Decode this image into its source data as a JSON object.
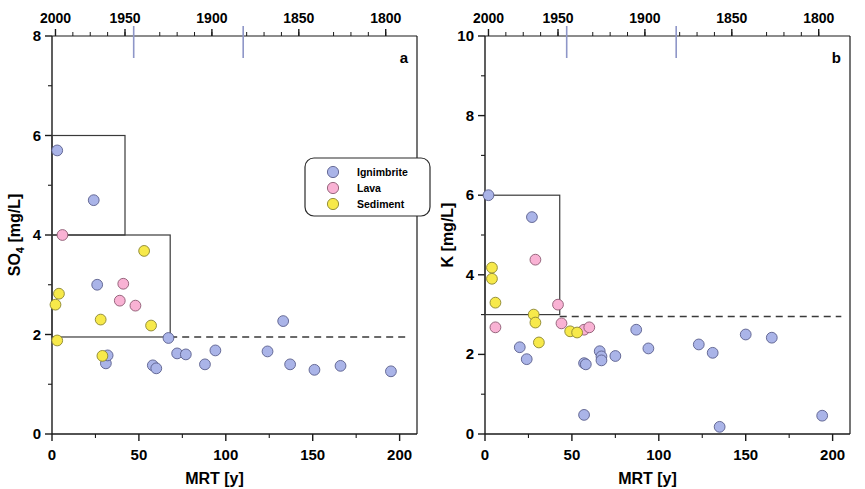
{
  "figure": {
    "panels": [
      {
        "letter": "a",
        "xlabel": "MRT [y]",
        "ylabel_main": "SO",
        "ylabel_sub": "4",
        "ylabel_unit": " [mg/L]",
        "ylabel_full": "SO4 [mg/L]"
      },
      {
        "letter": "b",
        "xlabel": "MRT [y]",
        "ylabel_main": "K",
        "ylabel_sub": "",
        "ylabel_unit": " [mg/L]",
        "ylabel_full": "K [mg/L]"
      }
    ]
  },
  "legend": {
    "position": "upper-right-panel-a",
    "items": [
      {
        "label": "Ignimbrite",
        "color": "#aab4e8",
        "edge": "#5a5f8c"
      },
      {
        "label": "Lava",
        "color": "#f9b2d4",
        "edge": "#8c5a72"
      },
      {
        "label": "Sediment",
        "color": "#f7e94a",
        "edge": "#8a8430"
      }
    ]
  },
  "colors": {
    "ignimbrite": "#aab4e8",
    "ignimbrite_edge": "#5a5f8c",
    "lava": "#f9b2d4",
    "lava_edge": "#8c5a72",
    "sediment": "#f7e94a",
    "sediment_edge": "#8a8430",
    "axis": "#1a1a1a",
    "box": "#3a3a3a",
    "dashed": "#3a3a3a",
    "top_marker": "#8e96c8"
  },
  "chart_data": [
    {
      "type": "scatter",
      "panel": "a",
      "title": "",
      "xlabel": "MRT [y]",
      "ylabel": "SO4 [mg/L]",
      "xlim": [
        0,
        210
      ],
      "ylim": [
        0,
        8
      ],
      "xticks": [
        0,
        50,
        100,
        150,
        200
      ],
      "xticklabels": [
        "0",
        "50",
        "100",
        "150",
        "200"
      ],
      "xminorticks": [
        25,
        75,
        125,
        175
      ],
      "yticks": [
        0,
        2,
        4,
        6,
        8
      ],
      "yticklabels": [
        "0",
        "2",
        "4",
        "6",
        "8"
      ],
      "yminorticks": [
        1,
        3,
        5,
        7
      ],
      "grid": false,
      "top_axis": {
        "label": "",
        "ticklabels": [
          "2000",
          "1950",
          "1900",
          "1850",
          "1800"
        ],
        "tickvalues_year": [
          2000,
          1950,
          1900,
          1850,
          1800
        ],
        "tick_x_mrt": [
          2,
          42,
          92,
          142,
          192
        ],
        "marker_years": [
          1952,
          1920
        ],
        "marker_x_mrt": [
          47,
          110
        ]
      },
      "reference_line": {
        "style": "dashed",
        "y": 1.95,
        "x_from": 68,
        "x_to": 205
      },
      "boxes": [
        {
          "x0": 0,
          "x1": 42,
          "y0": 4.0,
          "y1": 6.0
        },
        {
          "x0": 0,
          "x1": 68,
          "y0": 1.95,
          "y1": 4.0
        }
      ],
      "series": [
        {
          "name": "Ignimbrite",
          "color": "#aab4e8",
          "points": [
            [
              3,
              5.7
            ],
            [
              24,
              4.7
            ],
            [
              26,
              3.0
            ],
            [
              31,
              1.42
            ],
            [
              32,
              1.58
            ],
            [
              58,
              1.38
            ],
            [
              60,
              1.32
            ],
            [
              67,
              1.93
            ],
            [
              72,
              1.62
            ],
            [
              77,
              1.6
            ],
            [
              88,
              1.4
            ],
            [
              94,
              1.68
            ],
            [
              124,
              1.66
            ],
            [
              133,
              2.27
            ],
            [
              137,
              1.4
            ],
            [
              151,
              1.29
            ],
            [
              166,
              1.37
            ],
            [
              195,
              1.26
            ]
          ]
        },
        {
          "name": "Lava",
          "color": "#f9b2d4",
          "points": [
            [
              6,
              4.0
            ],
            [
              41,
              3.02
            ],
            [
              39,
              2.68
            ],
            [
              48,
              2.58
            ]
          ]
        },
        {
          "name": "Sediment",
          "color": "#f7e94a",
          "points": [
            [
              4,
              2.82
            ],
            [
              2,
              2.6
            ],
            [
              3,
              1.88
            ],
            [
              28,
              2.3
            ],
            [
              29,
              1.57
            ],
            [
              53,
              3.68
            ],
            [
              57,
              2.18
            ]
          ]
        }
      ]
    },
    {
      "type": "scatter",
      "panel": "b",
      "title": "",
      "xlabel": "MRT [y]",
      "ylabel": "K [mg/L]",
      "xlim": [
        0,
        210
      ],
      "ylim": [
        0,
        10
      ],
      "xticks": [
        0,
        50,
        100,
        150,
        200
      ],
      "xticklabels": [
        "0",
        "50",
        "100",
        "150",
        "200"
      ],
      "xminorticks": [
        25,
        75,
        125,
        175
      ],
      "yticks": [
        0,
        2,
        4,
        6,
        8,
        10
      ],
      "yticklabels": [
        "0",
        "2",
        "4",
        "6",
        "8",
        "10"
      ],
      "yminorticks": [
        1,
        3,
        5,
        7,
        9
      ],
      "grid": false,
      "top_axis": {
        "label": "",
        "ticklabels": [
          "2000",
          "1950",
          "1900",
          "1850",
          "1800"
        ],
        "tickvalues_year": [
          2000,
          1950,
          1900,
          1850,
          1800
        ],
        "tick_x_mrt": [
          2,
          42,
          92,
          142,
          192
        ],
        "marker_years": [
          1952,
          1920
        ],
        "marker_x_mrt": [
          47,
          110
        ]
      },
      "reference_line": {
        "style": "dashed",
        "y": 2.95,
        "x_from": 43,
        "x_to": 205
      },
      "boxes": [
        {
          "x0": 0,
          "x1": 43,
          "y0": 3.0,
          "y1": 6.0
        }
      ],
      "series": [
        {
          "name": "Ignimbrite",
          "color": "#aab4e8",
          "points": [
            [
              2,
              6.0
            ],
            [
              27,
              5.45
            ],
            [
              20,
              2.18
            ],
            [
              24,
              1.88
            ],
            [
              57,
              1.78
            ],
            [
              58,
              1.75
            ],
            [
              66,
              2.08
            ],
            [
              67,
              1.95
            ],
            [
              67,
              1.85
            ],
            [
              75,
              1.96
            ],
            [
              87,
              2.62
            ],
            [
              94,
              2.15
            ],
            [
              57,
              0.48
            ],
            [
              123,
              2.25
            ],
            [
              131,
              2.04
            ],
            [
              135,
              0.18
            ],
            [
              150,
              2.5
            ],
            [
              165,
              2.42
            ],
            [
              194,
              0.46
            ]
          ]
        },
        {
          "name": "Lava",
          "color": "#f9b2d4",
          "points": [
            [
              29,
              4.38
            ],
            [
              42,
              3.25
            ],
            [
              6,
              2.68
            ],
            [
              44,
              2.78
            ],
            [
              57,
              2.62
            ],
            [
              60,
              2.68
            ]
          ]
        },
        {
          "name": "Sediment",
          "color": "#f7e94a",
          "points": [
            [
              4,
              4.18
            ],
            [
              4,
              3.9
            ],
            [
              6,
              3.3
            ],
            [
              28,
              3.0
            ],
            [
              29,
              2.8
            ],
            [
              31,
              2.3
            ],
            [
              49,
              2.58
            ],
            [
              53,
              2.55
            ]
          ]
        }
      ]
    }
  ]
}
